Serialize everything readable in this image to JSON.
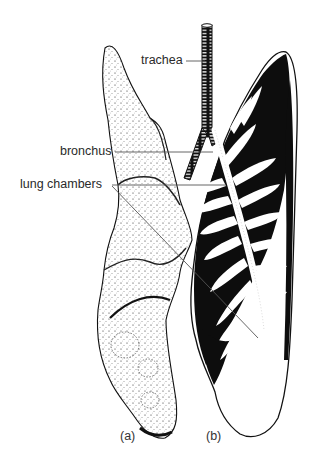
{
  "figure": {
    "colors": {
      "ink": "#111111",
      "background": "#ffffff",
      "leader": "#555555"
    },
    "labels": {
      "trachea": "trachea",
      "bronchus": "bronchus",
      "lung_chambers": "lung chambers"
    },
    "panels": {
      "a": "(a)",
      "b": "(b)"
    }
  }
}
